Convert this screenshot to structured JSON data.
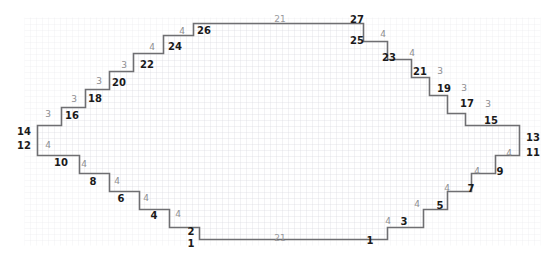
{
  "diagram": {
    "type": "stepped-polygon-on-grid",
    "grid": {
      "cell_px": 6.0,
      "origin_x": 24.5,
      "origin_y": 17.5,
      "cols": 86,
      "rows": 37,
      "line_color": "#d9d9de",
      "visible": true
    },
    "outline": {
      "stroke_color": "#6f6f72",
      "stroke_width": 1.6,
      "fill_color": "#ffffff",
      "unit_cells_x": 86,
      "unit_cells_y": 37
    },
    "colors": {
      "riser_label": "#1a1a1a",
      "tread_label": "#8d8d90",
      "grid_line": "#d9d9de",
      "outline": "#6f6f72",
      "background": "#ffffff"
    },
    "labels": {
      "risers": [
        {
          "text": "26",
          "x": 204,
          "y": 31
        },
        {
          "text": "24",
          "x": 175,
          "y": 47
        },
        {
          "text": "22",
          "x": 147,
          "y": 65
        },
        {
          "text": "20",
          "x": 119,
          "y": 83
        },
        {
          "text": "18",
          "x": 95,
          "y": 99
        },
        {
          "text": "16",
          "x": 72,
          "y": 116
        },
        {
          "text": "14",
          "x": 24,
          "y": 132
        },
        {
          "text": "12",
          "x": 24,
          "y": 146
        },
        {
          "text": "10",
          "x": 61,
          "y": 163
        },
        {
          "text": "8",
          "x": 93,
          "y": 182
        },
        {
          "text": "6",
          "x": 121,
          "y": 199
        },
        {
          "text": "4",
          "x": 154,
          "y": 216
        },
        {
          "text": "2",
          "x": 191,
          "y": 232
        },
        {
          "text": "1",
          "x": 191,
          "y": 244
        },
        {
          "text": "27",
          "x": 357,
          "y": 20
        },
        {
          "text": "25",
          "x": 357,
          "y": 41
        },
        {
          "text": "23",
          "x": 389,
          "y": 58
        },
        {
          "text": "21",
          "x": 420,
          "y": 72
        },
        {
          "text": "19",
          "x": 444,
          "y": 89
        },
        {
          "text": "17",
          "x": 467,
          "y": 104
        },
        {
          "text": "15",
          "x": 491,
          "y": 121
        },
        {
          "text": "13",
          "x": 533,
          "y": 138
        },
        {
          "text": "11",
          "x": 533,
          "y": 153
        },
        {
          "text": "9",
          "x": 500,
          "y": 172
        },
        {
          "text": "7",
          "x": 471,
          "y": 189
        },
        {
          "text": "5",
          "x": 440,
          "y": 206
        },
        {
          "text": "3",
          "x": 404,
          "y": 222
        },
        {
          "text": "1",
          "x": 370,
          "y": 241
        }
      ],
      "treads": [
        {
          "text": "4",
          "x": 182,
          "y": 31
        },
        {
          "text": "4",
          "x": 152,
          "y": 47
        },
        {
          "text": "3",
          "x": 124,
          "y": 65
        },
        {
          "text": "3",
          "x": 99,
          "y": 81
        },
        {
          "text": "3",
          "x": 74,
          "y": 99
        },
        {
          "text": "3",
          "x": 48,
          "y": 114
        },
        {
          "text": "4",
          "x": 48,
          "y": 145
        },
        {
          "text": "4",
          "x": 84,
          "y": 164
        },
        {
          "text": "4",
          "x": 117,
          "y": 181
        },
        {
          "text": "4",
          "x": 146,
          "y": 198
        },
        {
          "text": "4",
          "x": 178,
          "y": 214
        },
        {
          "text": "4",
          "x": 383,
          "y": 34
        },
        {
          "text": "4",
          "x": 412,
          "y": 53
        },
        {
          "text": "3",
          "x": 440,
          "y": 71
        },
        {
          "text": "3",
          "x": 464,
          "y": 88
        },
        {
          "text": "3",
          "x": 488,
          "y": 104
        },
        {
          "text": "4",
          "x": 509,
          "y": 153
        },
        {
          "text": "4",
          "x": 477,
          "y": 171
        },
        {
          "text": "4",
          "x": 447,
          "y": 188
        },
        {
          "text": "4",
          "x": 417,
          "y": 204
        },
        {
          "text": "4",
          "x": 388,
          "y": 221
        }
      ],
      "edges": [
        {
          "text": "21",
          "x": 280,
          "y": 19
        },
        {
          "text": "21",
          "x": 280,
          "y": 238
        }
      ]
    }
  }
}
